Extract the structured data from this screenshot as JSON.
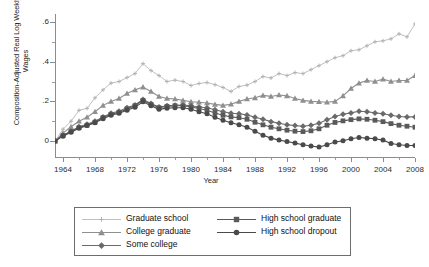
{
  "chart_data": {
    "type": "line",
    "title": "",
    "xlabel": "Year",
    "ylabel": "Composition-Adjusted Real Log Weekly Wages",
    "xlim": [
      1963,
      2008
    ],
    "ylim": [
      -0.08,
      0.64
    ],
    "xticks": [
      1964,
      1968,
      1972,
      1976,
      1980,
      1984,
      1988,
      1992,
      1996,
      2000,
      2004,
      2008
    ],
    "xtick_labels": [
      "1964",
      "1968",
      "1972",
      "1976",
      "1980",
      "1984",
      "1988",
      "1992",
      "1996",
      "2000",
      "2004",
      "2008"
    ],
    "yticks": [
      0,
      0.2,
      0.4,
      0.6
    ],
    "ytick_labels": [
      "0",
      ".2",
      ".4",
      ".6"
    ],
    "grid": false,
    "legend_position": "below-plot",
    "x": [
      1963,
      1964,
      1965,
      1966,
      1967,
      1968,
      1969,
      1970,
      1971,
      1972,
      1973,
      1974,
      1975,
      1976,
      1977,
      1978,
      1979,
      1980,
      1981,
      1982,
      1983,
      1984,
      1985,
      1986,
      1987,
      1988,
      1989,
      1990,
      1991,
      1992,
      1993,
      1994,
      1995,
      1996,
      1997,
      1998,
      1999,
      2000,
      2001,
      2002,
      2003,
      2004,
      2005,
      2006,
      2007,
      2008
    ],
    "series": [
      {
        "name": "Graduate school",
        "marker": "plus",
        "color": "#b0b0b0",
        "values": [
          0.0,
          0.06,
          0.1,
          0.155,
          0.165,
          0.218,
          0.258,
          0.292,
          0.3,
          0.32,
          0.34,
          0.39,
          0.355,
          0.33,
          0.3,
          0.307,
          0.3,
          0.28,
          0.29,
          0.295,
          0.284,
          0.27,
          0.25,
          0.275,
          0.282,
          0.3,
          0.325,
          0.318,
          0.34,
          0.33,
          0.345,
          0.34,
          0.36,
          0.38,
          0.4,
          0.42,
          0.43,
          0.455,
          0.46,
          0.48,
          0.5,
          0.505,
          0.515,
          0.54,
          0.525,
          0.59
        ]
      },
      {
        "name": "College graduate",
        "marker": "triangle",
        "color": "#8f8f8f",
        "values": [
          0.0,
          0.04,
          0.072,
          0.1,
          0.12,
          0.148,
          0.18,
          0.2,
          0.215,
          0.24,
          0.258,
          0.272,
          0.25,
          0.225,
          0.215,
          0.212,
          0.205,
          0.198,
          0.196,
          0.192,
          0.185,
          0.18,
          0.186,
          0.2,
          0.212,
          0.218,
          0.23,
          0.225,
          0.232,
          0.228,
          0.215,
          0.205,
          0.2,
          0.198,
          0.196,
          0.2,
          0.228,
          0.265,
          0.292,
          0.305,
          0.3,
          0.312,
          0.3,
          0.305,
          0.305,
          0.33
        ]
      },
      {
        "name": "Some college",
        "marker": "diamond",
        "color": "#6a6a6a",
        "values": [
          0.0,
          0.03,
          0.05,
          0.072,
          0.085,
          0.1,
          0.122,
          0.14,
          0.15,
          0.168,
          0.182,
          0.21,
          0.19,
          0.172,
          0.178,
          0.18,
          0.182,
          0.178,
          0.172,
          0.168,
          0.158,
          0.148,
          0.14,
          0.138,
          0.132,
          0.12,
          0.11,
          0.098,
          0.09,
          0.082,
          0.078,
          0.075,
          0.08,
          0.09,
          0.108,
          0.124,
          0.135,
          0.142,
          0.15,
          0.148,
          0.142,
          0.138,
          0.13,
          0.124,
          0.122,
          0.122
        ]
      },
      {
        "name": "High school graduate",
        "marker": "square",
        "color": "#5a5a5a",
        "values": [
          0.0,
          0.028,
          0.048,
          0.068,
          0.08,
          0.095,
          0.118,
          0.135,
          0.145,
          0.162,
          0.178,
          0.205,
          0.185,
          0.168,
          0.175,
          0.178,
          0.178,
          0.172,
          0.164,
          0.155,
          0.142,
          0.13,
          0.122,
          0.118,
          0.11,
          0.095,
          0.082,
          0.07,
          0.062,
          0.055,
          0.05,
          0.048,
          0.052,
          0.062,
          0.08,
          0.094,
          0.102,
          0.108,
          0.112,
          0.11,
          0.105,
          0.098,
          0.088,
          0.08,
          0.075,
          0.07
        ]
      },
      {
        "name": "High school dropout",
        "marker": "circle",
        "color": "#4a4a4a",
        "values": [
          0.0,
          0.025,
          0.045,
          0.065,
          0.078,
          0.092,
          0.112,
          0.13,
          0.14,
          0.155,
          0.17,
          0.198,
          0.178,
          0.16,
          0.166,
          0.168,
          0.168,
          0.16,
          0.148,
          0.138,
          0.12,
          0.105,
          0.092,
          0.082,
          0.07,
          0.05,
          0.03,
          0.015,
          0.005,
          -0.002,
          -0.01,
          -0.018,
          -0.025,
          -0.03,
          -0.018,
          -0.005,
          0.002,
          0.012,
          0.018,
          0.015,
          0.012,
          0.005,
          -0.012,
          -0.018,
          -0.022,
          -0.022
        ]
      }
    ]
  },
  "legend": {
    "columns": [
      {
        "entries": [
          {
            "label": "Graduate school",
            "marker": "plus",
            "color": "#b0b0b0"
          },
          {
            "label": "College graduate",
            "marker": "triangle",
            "color": "#8f8f8f"
          },
          {
            "label": "Some college",
            "marker": "diamond",
            "color": "#6a6a6a"
          }
        ]
      },
      {
        "entries": [
          {
            "label": "High school graduate",
            "marker": "square",
            "color": "#5a5a5a"
          },
          {
            "label": "High school dropout",
            "marker": "circle",
            "color": "#4a4a4a"
          }
        ]
      }
    ]
  }
}
